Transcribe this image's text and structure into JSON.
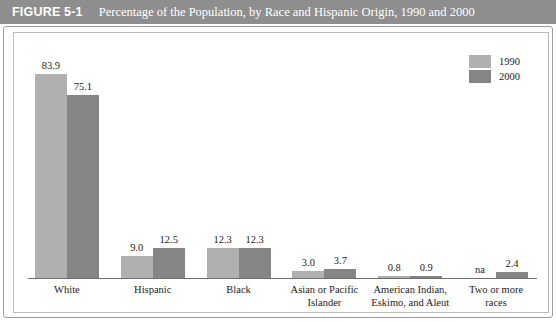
{
  "header": {
    "figure_number": "FIGURE 5-1",
    "title": "Percentage of the Population, by Race and Hispanic Origin, 1990 and 2000",
    "bar_color": "#8e8e8e",
    "text_color": "#ffffff"
  },
  "legend": {
    "position": "top-right",
    "items": [
      {
        "label": "1990",
        "color": "#b0b0b0"
      },
      {
        "label": "2000",
        "color": "#858585"
      }
    ]
  },
  "chart_data": {
    "type": "bar",
    "title": "Percentage of the Population, by Race and Hispanic Origin, 1990 and 2000",
    "xlabel": "",
    "ylabel": "",
    "ylim": [
      0,
      90
    ],
    "grid": false,
    "legend_position": "top-right",
    "categories": [
      "White",
      "Hispanic",
      "Black",
      "Asian or Pacific Islander",
      "American Indian, Eskimo, and Aleut",
      "Two or more races"
    ],
    "category_lines": [
      [
        "White"
      ],
      [
        "Hispanic"
      ],
      [
        "Black"
      ],
      [
        "Asian or Pacific",
        "Islander"
      ],
      [
        "American Indian,",
        "Eskimo, and Aleut"
      ],
      [
        "Two or more",
        "races"
      ]
    ],
    "series": [
      {
        "name": "1990",
        "color": "#b0b0b0",
        "values": [
          83.9,
          9.0,
          12.3,
          3.0,
          0.8,
          null
        ],
        "labels": [
          "83.9",
          "9.0",
          "12.3",
          "3.0",
          "0.8",
          "na"
        ]
      },
      {
        "name": "2000",
        "color": "#858585",
        "values": [
          75.1,
          12.5,
          12.3,
          3.7,
          0.9,
          2.4
        ],
        "labels": [
          "75.1",
          "12.5",
          "12.3",
          "3.7",
          "0.9",
          "2.4"
        ]
      }
    ]
  }
}
